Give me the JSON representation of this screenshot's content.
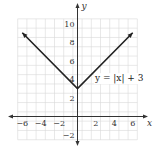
{
  "chart_data": {
    "type": "line",
    "title": "",
    "xlabel": "x",
    "ylabel": "y",
    "xlim": [
      -6.5,
      6.5
    ],
    "ylim": [
      -2.5,
      10.5
    ],
    "grid": true,
    "x_ticks": [
      -6,
      -4,
      -2,
      2,
      4,
      6
    ],
    "x_tick_labels": [
      "−6",
      "−4",
      "−2",
      "2",
      "4",
      "6"
    ],
    "y_ticks": [
      -2,
      2,
      4,
      6,
      8,
      10
    ],
    "y_tick_labels": [
      "−2",
      "2",
      "4",
      "6",
      "8",
      "10"
    ],
    "series": [
      {
        "name": "y = |x| + 3",
        "x": [
          -6,
          0,
          6
        ],
        "y": [
          9,
          3,
          9
        ],
        "arrows_at_ends": true
      }
    ],
    "annotations": [
      {
        "text": "y = |x| + 3",
        "x": 1.9,
        "y": 3.8
      }
    ],
    "colors": {
      "line": "#222222",
      "grid": "#d8d8d8",
      "axis": "#333333"
    }
  }
}
